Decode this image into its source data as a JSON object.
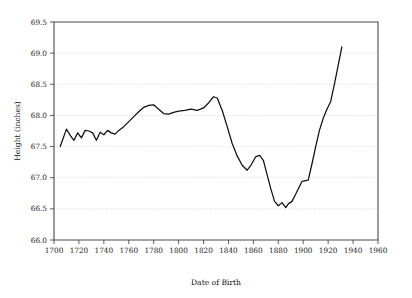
{
  "chart_data": {
    "type": "line",
    "title": "",
    "xlabel": "Date of Birth",
    "ylabel": "Height (inches)",
    "xlim": [
      1700,
      1960
    ],
    "ylim": [
      66.0,
      69.5
    ],
    "xticks": [
      1700,
      1720,
      1740,
      1760,
      1780,
      1800,
      1820,
      1840,
      1860,
      1880,
      1900,
      1920,
      1940,
      1960
    ],
    "xtick_labels": [
      "1700",
      "1720",
      "1740",
      "1760",
      "1780",
      "1800",
      "1820",
      "1840",
      "1860",
      "1880",
      "1900",
      "1920",
      "1940",
      "1960"
    ],
    "yticks": [
      66.0,
      66.5,
      67.0,
      67.5,
      68.0,
      68.5,
      69.0,
      69.5
    ],
    "ytick_labels": [
      "66.0",
      "66.5",
      "67.0",
      "67.5",
      "68.0",
      "68.5",
      "69.0",
      "69.5"
    ],
    "grid": "horizontal-dotted",
    "legend": null,
    "legend_position": "none",
    "series": [
      {
        "name": "Mean height by birth cohort",
        "color": "#101010",
        "x": [
          1705,
          1710,
          1713,
          1716,
          1719,
          1722,
          1725,
          1728,
          1731,
          1734,
          1737,
          1740,
          1743,
          1746,
          1749,
          1752,
          1756,
          1760,
          1764,
          1768,
          1772,
          1776,
          1780,
          1784,
          1788,
          1792,
          1796,
          1800,
          1805,
          1810,
          1815,
          1820,
          1824,
          1828,
          1831,
          1835,
          1839,
          1843,
          1847,
          1851,
          1855,
          1858,
          1862,
          1865,
          1868,
          1871,
          1874,
          1877,
          1880,
          1883,
          1886,
          1888,
          1891,
          1894,
          1897,
          1899,
          1901,
          1904,
          1907,
          1910,
          1913,
          1916,
          1919,
          1922,
          1925,
          1928,
          1931
        ],
        "y": [
          67.5,
          67.78,
          67.68,
          67.6,
          67.72,
          67.64,
          67.76,
          67.75,
          67.72,
          67.6,
          67.73,
          67.69,
          67.76,
          67.72,
          67.7,
          67.76,
          67.82,
          67.9,
          67.98,
          68.06,
          68.13,
          68.16,
          68.17,
          68.1,
          68.03,
          68.02,
          68.05,
          68.07,
          68.08,
          68.1,
          68.08,
          68.12,
          68.2,
          68.3,
          68.28,
          68.08,
          67.82,
          67.55,
          67.35,
          67.2,
          67.12,
          67.2,
          67.34,
          67.36,
          67.28,
          67.05,
          66.82,
          66.62,
          66.55,
          66.6,
          66.52,
          66.58,
          66.62,
          66.74,
          66.86,
          66.94,
          66.95,
          66.96,
          67.22,
          67.5,
          67.76,
          67.95,
          68.1,
          68.22,
          68.5,
          68.8,
          69.1
        ]
      }
    ]
  },
  "axes": {
    "x_title": "Date of Birth",
    "y_title": "Height (inches)"
  }
}
